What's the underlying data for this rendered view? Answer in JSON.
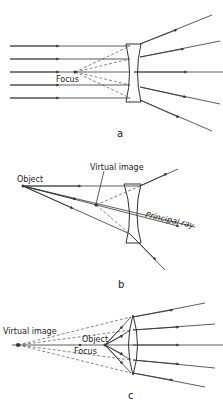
{
  "panels": {
    "a": {
      "caption": "a",
      "focus_label": "Focus",
      "lens": "diverging (concave)"
    },
    "b": {
      "caption": "b",
      "object_label": "Object",
      "virtual_image_label": "Virtual image",
      "principal_ray_label": "Principal ray",
      "lens": "diverging (concave)"
    },
    "c": {
      "caption": "c",
      "virtual_image_label": "Virtual image",
      "object_label": "Object",
      "focus_label": "Focus",
      "lens": "converging (convex)"
    }
  }
}
